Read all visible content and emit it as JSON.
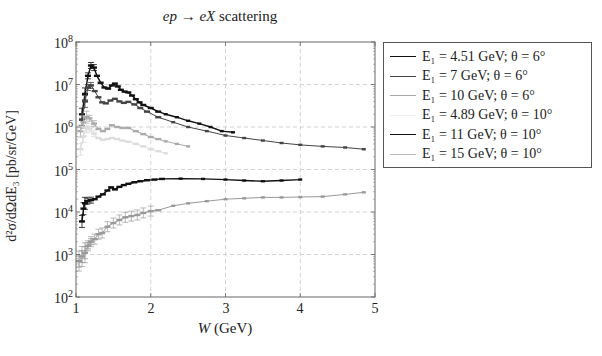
{
  "chart_data": {
    "type": "line",
    "title": "ep → eX scattering",
    "xlabel": "W (GeV)",
    "ylabel": "d²σ/dΩdE₃ [pb/sr/GeV]",
    "xlim": [
      1,
      5
    ],
    "ylim": [
      100,
      100000000
    ],
    "yscale": "log",
    "grid": true,
    "legend_position": "outside-right-top",
    "x_ticks": [
      "1",
      "2",
      "3",
      "4",
      "5"
    ],
    "y_ticks": [
      "10^2",
      "10^3",
      "10^4",
      "10^5",
      "10^6",
      "10^7",
      "10^8"
    ],
    "series": [
      {
        "name": "E1 = 4.51 GeV; θ = 6°",
        "color": "#111111",
        "width": 1.4,
        "x": [
          1.08,
          1.12,
          1.16,
          1.2,
          1.24,
          1.28,
          1.33,
          1.38,
          1.43,
          1.48,
          1.52,
          1.56,
          1.6,
          1.65,
          1.7,
          1.75,
          1.8,
          1.85,
          1.9,
          2.0,
          2.1,
          2.2,
          2.35,
          2.5,
          2.65,
          2.8,
          2.95,
          3.1
        ],
        "y": [
          2000000.0,
          6000000.0,
          16000000.0,
          28000000.0,
          25000000.0,
          16000000.0,
          11000000.0,
          8500000.0,
          8000000.0,
          9500000.0,
          10500000.0,
          9000000.0,
          7500000.0,
          6800000.0,
          6500000.0,
          5500000.0,
          4500000.0,
          3800000.0,
          3300000.0,
          2800000.0,
          2300000.0,
          2000000.0,
          1700000.0,
          1400000.0,
          1200000.0,
          1000000.0,
          800000.0,
          750000.0
        ]
      },
      {
        "name": "E1 = 7 GeV; θ = 6°",
        "color": "#444444",
        "width": 1.0,
        "x": [
          1.08,
          1.12,
          1.16,
          1.2,
          1.25,
          1.3,
          1.35,
          1.4,
          1.46,
          1.52,
          1.58,
          1.64,
          1.7,
          1.78,
          1.86,
          1.95,
          2.1,
          2.3,
          2.5,
          2.75,
          3.0,
          3.25,
          3.5,
          3.75,
          4.0,
          4.3,
          4.6,
          4.85
        ],
        "y": [
          1500000.0,
          4000000.0,
          8500000.0,
          9500000.0,
          7000000.0,
          5000000.0,
          3800000.0,
          3600000.0,
          4200000.0,
          4600000.0,
          4000000.0,
          3700000.0,
          3900000.0,
          3400000.0,
          2800000.0,
          2300000.0,
          1700000.0,
          1300000.0,
          1000000.0,
          800000.0,
          630000.0,
          550000.0,
          480000.0,
          420000.0,
          380000.0,
          350000.0,
          330000.0,
          300000.0
        ]
      },
      {
        "name": "E1 = 10 GeV; θ = 6°",
        "color": "#aaaaaa",
        "width": 1.0,
        "x": [
          1.06,
          1.1,
          1.14,
          1.18,
          1.24,
          1.3,
          1.36,
          1.42,
          1.48,
          1.55,
          1.62,
          1.7,
          1.8,
          1.9,
          2.0,
          2.1,
          2.2,
          2.35,
          2.5
        ],
        "y": [
          800000.0,
          1300000.0,
          1700000.0,
          1600000.0,
          1200000.0,
          900000.0,
          800000.0,
          900000.0,
          1100000.0,
          1000000.0,
          950000.0,
          950000.0,
          800000.0,
          680000.0,
          580000.0,
          520000.0,
          460000.0,
          400000.0,
          350000.0
        ]
      },
      {
        "name": "E1 = 4.89 GeV; θ = 10°",
        "color": "#dddddd",
        "width": 1.0,
        "x": [
          1.06,
          1.1,
          1.14,
          1.18,
          1.24,
          1.3,
          1.36,
          1.42,
          1.48,
          1.55,
          1.62,
          1.7,
          1.8,
          1.9,
          2.0,
          2.1,
          2.2
        ],
        "y": [
          300000.0,
          600000.0,
          1000000.0,
          900000.0,
          700000.0,
          550000.0,
          500000.0,
          520000.0,
          550000.0,
          520000.0,
          480000.0,
          450000.0,
          400000.0,
          350000.0,
          300000.0,
          270000.0,
          240000.0
        ]
      },
      {
        "name": "E1 = 11 GeV; θ = 10°",
        "color": "#111111",
        "width": 1.4,
        "x": [
          1.08,
          1.1,
          1.12,
          1.15,
          1.2,
          1.25,
          1.3,
          1.36,
          1.42,
          1.47,
          1.52,
          1.58,
          1.64,
          1.7,
          1.78,
          1.86,
          1.95,
          2.05,
          2.15,
          2.4,
          2.7,
          3.0,
          3.25,
          3.5,
          3.75,
          4.0
        ],
        "y": [
          6000.0,
          12000.0,
          16000.0,
          18000.0,
          19000.0,
          20000.0,
          23000.0,
          26000.0,
          32000.0,
          38000.0,
          34000.0,
          39000.0,
          43000.0,
          46000.0,
          50000.0,
          53000.0,
          56000.0,
          58000.0,
          60000.0,
          61000.0,
          60000.0,
          58000.0,
          55000.0,
          53000.0,
          55000.0,
          58000.0
        ]
      },
      {
        "name": "E1 = 15 GeV; θ = 10°",
        "color": "#999999",
        "width": 1.0,
        "x": [
          1.04,
          1.08,
          1.12,
          1.16,
          1.2,
          1.25,
          1.3,
          1.35,
          1.42,
          1.5,
          1.58,
          1.66,
          1.74,
          1.82,
          1.9,
          2.0,
          2.1,
          2.3,
          2.5,
          2.75,
          3.0,
          3.25,
          3.5,
          3.75,
          4.0,
          4.3,
          4.6,
          4.85
        ],
        "y": [
          700.0,
          900.0,
          1100.0,
          1600.0,
          2000.0,
          2300.0,
          3000.0,
          3200.0,
          4500.0,
          5500.0,
          6500.0,
          7500.0,
          8000.0,
          8500.0,
          9500.0,
          10500.0,
          11000.0,
          14000.0,
          16000.0,
          18000.0,
          20000.0,
          21000.0,
          22000.0,
          22000.0,
          22500.0,
          23000.0,
          26000.0,
          29000.0
        ]
      }
    ]
  },
  "title": {
    "prefix": "ep → eX",
    "suffix": " scattering"
  },
  "axes": {
    "xlabel_var": "W",
    "xlabel_unit": " (GeV)",
    "ylabel": "d²σ/dΩdE₃ [pb/sr/GeV]",
    "x_ticks": [
      "1",
      "2",
      "3",
      "4",
      "5"
    ],
    "y_ticks": [
      {
        "base": "10",
        "exp": "8"
      },
      {
        "base": "10",
        "exp": "7"
      },
      {
        "base": "10",
        "exp": "6"
      },
      {
        "base": "10",
        "exp": "5"
      },
      {
        "base": "10",
        "exp": "4"
      },
      {
        "base": "10",
        "exp": "3"
      },
      {
        "base": "10",
        "exp": "2"
      }
    ]
  },
  "legend": {
    "entries": [
      {
        "label": "E₁ = 4.51 GeV; θ = 6°",
        "color": "#111111"
      },
      {
        "label": "E₁ = 7 GeV; θ = 6°",
        "color": "#444444"
      },
      {
        "label": "E₁ = 10 GeV; θ = 6°",
        "color": "#aaaaaa"
      },
      {
        "label": "E₁ = 4.89 GeV; θ = 10°",
        "color": "#eeeeee"
      },
      {
        "label": "E₁ = 11 GeV; θ = 10°",
        "color": "#111111"
      },
      {
        "label": "E₁ = 15 GeV; θ = 10°",
        "color": "#bbbbbb"
      }
    ]
  }
}
